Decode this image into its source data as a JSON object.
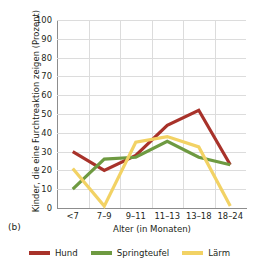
{
  "panel": {
    "label": "(b)"
  },
  "chart_data": {
    "type": "line",
    "title": "",
    "xlabel": "Alter (in Monaten)",
    "ylabel": "Kinder, die eine Furchtreaktion zeigen (Prozent)",
    "categories": [
      "<7",
      "7–9",
      "9–11",
      "11–13",
      "13–18",
      "18–24"
    ],
    "ylim": [
      0,
      100
    ],
    "yticks": [
      0,
      10,
      20,
      30,
      40,
      50,
      60,
      70,
      80,
      90,
      100
    ],
    "grid": true,
    "legend_position": "bottom",
    "series": [
      {
        "name": "Hund",
        "color": "#A8322A",
        "values": [
          30,
          20,
          28,
          44,
          52,
          23
        ]
      },
      {
        "name": "Springteufel",
        "color": "#6E9A41",
        "values": [
          10,
          26,
          27,
          35.5,
          27,
          23
        ]
      },
      {
        "name": "Lärm",
        "color": "#F2D264",
        "values": [
          21,
          1,
          35,
          38,
          32.5,
          1
        ]
      }
    ]
  },
  "colors": {
    "axis": "#8d8d8d",
    "grid": "#dcdcdc",
    "text": "#231f20",
    "background": "#ffffff"
  }
}
